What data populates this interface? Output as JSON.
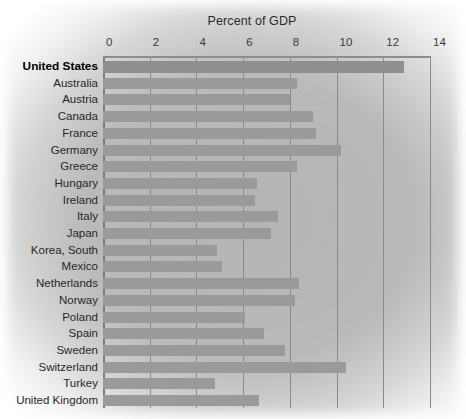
{
  "chart_data": {
    "type": "bar",
    "orientation": "horizontal",
    "title": "Percent of GDP",
    "xlabel": "",
    "ylabel": "",
    "xlim": [
      0,
      14
    ],
    "xticks": [
      0,
      2,
      4,
      6,
      8,
      10,
      12,
      14
    ],
    "tick_labels": [
      "0",
      "2",
      "4",
      "6",
      "8",
      "10",
      "12",
      "14"
    ],
    "grid": true,
    "legend": "none",
    "highlight_category": "United States",
    "bar_color": "#9a9a9a",
    "highlight_bar_color": "#8f8f8f",
    "background_color": "#b4b4b4",
    "categories": [
      "United States",
      "Australia",
      "Austria",
      "Canada",
      "France",
      "Germany",
      "Greece",
      "Hungary",
      "Ireland",
      "Italy",
      "Japan",
      "Korea, South",
      "Mexico",
      "Netherlands",
      "Norway",
      "Poland",
      "Spain",
      "Sweden",
      "Switzerland",
      "Turkey",
      "United Kingdom"
    ],
    "values": [
      12.9,
      8.3,
      8.0,
      9.0,
      9.1,
      10.2,
      8.3,
      6.6,
      6.5,
      7.5,
      7.2,
      4.9,
      5.1,
      8.4,
      8.2,
      6.1,
      6.9,
      7.8,
      10.4,
      4.8,
      6.7
    ]
  }
}
